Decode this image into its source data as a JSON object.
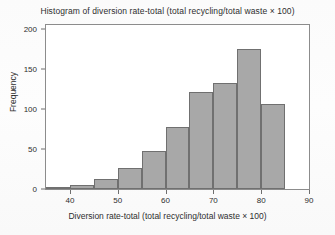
{
  "chart_data": {
    "type": "bar",
    "title": "Histogram of diversion rate-total (total recycling/total waste × 100)",
    "xlabel": "Diversion rate-total (total recycling/total waste × 100)",
    "ylabel": "Frequency",
    "xlim": [
      35,
      90
    ],
    "ylim": [
      0,
      205
    ],
    "grid": false,
    "legend": null,
    "bin_width": 5,
    "bin_edges": [
      35,
      40,
      45,
      50,
      55,
      60,
      65,
      70,
      75,
      80,
      85
    ],
    "categories": [
      "35-40",
      "40-45",
      "45-50",
      "50-55",
      "55-60",
      "60-65",
      "65-70",
      "70-75",
      "75-80",
      "80-85"
    ],
    "values": [
      3,
      5,
      13,
      26,
      47,
      77,
      121,
      133,
      175,
      106
    ],
    "bar_color": "#a8a8a8",
    "bar_edge_color": "#707070",
    "xticks": [
      40,
      50,
      60,
      70,
      80,
      90
    ],
    "xtick_labels": [
      "40",
      "50",
      "60",
      "70",
      "80",
      "90"
    ],
    "yticks": [
      0,
      50,
      100,
      150,
      200
    ],
    "ytick_labels": [
      "0",
      "50",
      "100",
      "150",
      "200"
    ]
  }
}
